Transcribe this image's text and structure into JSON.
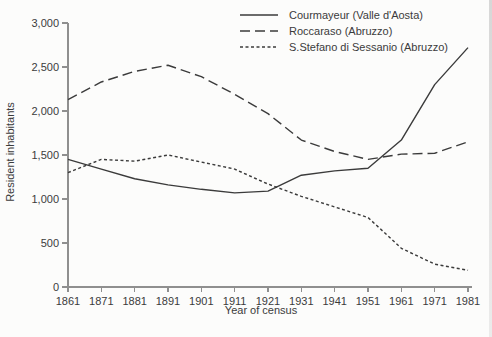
{
  "figure": {
    "kind": "scanned-textbook-line-chart"
  },
  "colors": {
    "background": "#fcfcfb",
    "line": "#3b3b3b",
    "axis": "#8f8f8f",
    "text": "#3b3b3b"
  },
  "chart_data": {
    "type": "line",
    "title": "",
    "xlabel": "Year of census",
    "ylabel": "Resident inhabitants",
    "categories": [
      "1861",
      "1871",
      "1881",
      "1891",
      "1901",
      "1911",
      "1921",
      "1931",
      "1941",
      "1951",
      "1961",
      "1971",
      "1981"
    ],
    "ylim": [
      0,
      3000
    ],
    "ytick_step": 500,
    "ytick_labels": [
      "0",
      "500",
      "1,000",
      "1,500",
      "2,000",
      "2,500",
      "3,000"
    ],
    "grid": false,
    "legend_position": "top-right",
    "series": [
      {
        "id": "courmayeur",
        "name": "Courmayeur (Valle d'Aosta)",
        "line_style": "solid",
        "dash": "",
        "values": [
          1450,
          1340,
          1230,
          1160,
          1110,
          1070,
          1090,
          1270,
          1320,
          1350,
          1670,
          2300,
          2720
        ]
      },
      {
        "id": "roccaraso",
        "name": "Roccaraso (Abruzzo)",
        "line_style": "long-dash",
        "dash": "10 5",
        "values": [
          2130,
          2330,
          2450,
          2520,
          2390,
          2190,
          1970,
          1670,
          1540,
          1450,
          1510,
          1520,
          1650
        ]
      },
      {
        "id": "s-stefano-di-sessanio",
        "name": "S.Stefano di Sessanio (Abruzzo)",
        "line_style": "fine-dash",
        "dash": "3 2.5",
        "values": [
          1300,
          1450,
          1430,
          1500,
          1420,
          1340,
          1170,
          1030,
          910,
          790,
          440,
          260,
          190
        ]
      }
    ]
  }
}
